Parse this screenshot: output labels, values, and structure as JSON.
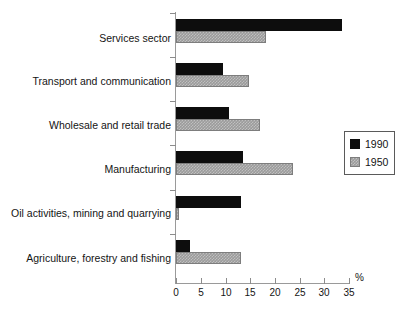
{
  "chart_data": {
    "type": "bar",
    "orientation": "horizontal",
    "title": "",
    "xlabel": "%",
    "ylabel": "",
    "xlim": [
      0,
      35
    ],
    "xticks": [
      0,
      5,
      10,
      15,
      20,
      25,
      30,
      35
    ],
    "grid": false,
    "legend_position": "right",
    "categories": [
      "Services sector",
      "Transport and communication",
      "Wholesale and retail trade",
      "Manufacturing",
      "Oil activities, mining and quarrying",
      "Agriculture, forestry and fishing"
    ],
    "series": [
      {
        "name": "1990",
        "color": "#0d0d0d",
        "values": [
          33.5,
          9.6,
          10.8,
          13.5,
          13.2,
          2.8
        ]
      },
      {
        "name": "1950",
        "color": "#9b9b9b",
        "values": [
          18.2,
          14.7,
          16.9,
          23.6,
          0.6,
          13.1
        ]
      }
    ]
  },
  "legend": {
    "items": [
      {
        "label": "1990",
        "swatch": "series-1990-swatch"
      },
      {
        "label": "1950",
        "swatch": "series-1950-swatch"
      }
    ]
  },
  "axis": {
    "unit_label": "%",
    "tick_labels": [
      "0",
      "5",
      "10",
      "15",
      "20",
      "25",
      "30",
      "35"
    ]
  }
}
